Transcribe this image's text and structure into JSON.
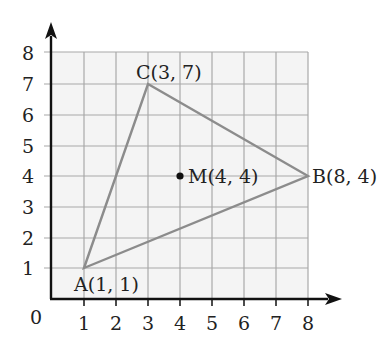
{
  "diagram": {
    "type": "coordinate-grid-triangle",
    "origin_label": "0",
    "x_ticks": [
      "1",
      "2",
      "3",
      "4",
      "5",
      "6",
      "7",
      "8"
    ],
    "y_ticks": [
      "1",
      "2",
      "3",
      "4",
      "5",
      "6",
      "7",
      "8"
    ],
    "grid": {
      "xmin": 0,
      "xmax": 8,
      "ymin": 0,
      "ymax": 8,
      "fill": "#f4f4f4",
      "line_color": "#a8a8a8"
    },
    "axis_color": "#111111",
    "triangle_color": "#8c8c8c",
    "points": {
      "A": {
        "x": 1,
        "y": 1,
        "label": "A(1, 1)"
      },
      "B": {
        "x": 8,
        "y": 4,
        "label": "B(8, 4)"
      },
      "C": {
        "x": 3,
        "y": 7,
        "label": "C(3, 7)"
      },
      "M": {
        "x": 4,
        "y": 4,
        "label": "M(4, 4)"
      }
    }
  }
}
